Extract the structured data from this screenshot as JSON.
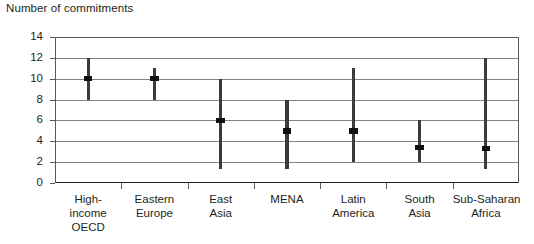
{
  "chart_data": {
    "type": "bar",
    "subtype": "range-bar-with-median-marker",
    "title": "",
    "ylabel": "Number of commitments",
    "xlabel": "",
    "ylim": [
      0,
      14
    ],
    "yticks": [
      0,
      2,
      4,
      6,
      8,
      10,
      12,
      14
    ],
    "ytick_labels": [
      "0",
      "2",
      "4",
      "6",
      "8",
      "10",
      "12",
      "14"
    ],
    "grid": true,
    "grid_axis": "y",
    "legend": false,
    "categories": [
      "High-income OECD",
      "Eastern Europe",
      "East Asia",
      "MENA",
      "Latin America",
      "South Asia",
      "Sub-Saharan Africa"
    ],
    "category_label_lines": [
      [
        "High-",
        "income",
        "OECD"
      ],
      [
        "Eastern",
        "Europe"
      ],
      [
        "East",
        "Asia"
      ],
      [
        "MENA"
      ],
      [
        "Latin",
        "America"
      ],
      [
        "South",
        "Asia"
      ],
      [
        "Sub-Saharan",
        "Africa"
      ]
    ],
    "series": [
      {
        "name": "minimum",
        "values": [
          8,
          8,
          1.3,
          1.3,
          2,
          2,
          1.3
        ]
      },
      {
        "name": "maximum",
        "values": [
          12,
          11,
          10,
          8,
          11,
          6,
          12
        ]
      },
      {
        "name": "median",
        "values": [
          10,
          10,
          6,
          5,
          5,
          3.4,
          3.3
        ]
      }
    ],
    "points": [
      {
        "category": "High-income OECD",
        "low": 8,
        "high": 12,
        "median": 10
      },
      {
        "category": "Eastern Europe",
        "low": 8,
        "high": 11,
        "median": 10
      },
      {
        "category": "East Asia",
        "low": 1.3,
        "high": 10,
        "median": 6
      },
      {
        "category": "MENA",
        "low": 1.3,
        "high": 8,
        "median": 5
      },
      {
        "category": "Latin America",
        "low": 2,
        "high": 11,
        "median": 5
      },
      {
        "category": "South Asia",
        "low": 2,
        "high": 6,
        "median": 3.4
      },
      {
        "category": "Sub-Saharan Africa",
        "low": 1.3,
        "high": 12,
        "median": 3.3
      }
    ],
    "colors": {
      "bar": "#3b3b3d",
      "marker": "#111111",
      "gridline": "#808285",
      "axis": "#231f20",
      "text": "#231f20",
      "background": "#ffffff"
    }
  }
}
